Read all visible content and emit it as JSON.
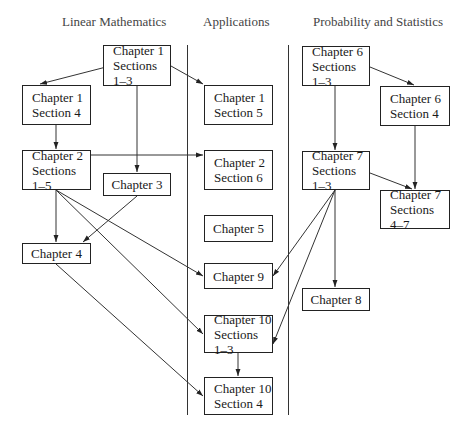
{
  "columns": [
    {
      "title": "Linear Mathematics",
      "x": 62
    },
    {
      "title": "Applications",
      "x": 203
    },
    {
      "title": "Probability and Statistics",
      "x": 313
    }
  ],
  "nodes": [
    {
      "id": "ch1s13",
      "line1": "Chapter 1",
      "line2": "Sections 1–3",
      "x": 103,
      "y": 45,
      "w": 68,
      "h": 41
    },
    {
      "id": "ch1s4",
      "line1": "Chapter 1",
      "line2": "Section 4",
      "x": 22,
      "y": 85,
      "w": 69,
      "h": 40
    },
    {
      "id": "ch1s5",
      "line1": "Chapter 1",
      "line2": "Section 5",
      "x": 204,
      "y": 85,
      "w": 69,
      "h": 40
    },
    {
      "id": "ch2s15",
      "line1": "Chapter 2",
      "line2": "Sections 1–5",
      "x": 22,
      "y": 150,
      "w": 69,
      "h": 40
    },
    {
      "id": "ch3",
      "line1": "Chapter 3",
      "line2": "",
      "x": 103,
      "y": 173,
      "w": 68,
      "h": 23
    },
    {
      "id": "ch2s6",
      "line1": "Chapter 2",
      "line2": "Section 6",
      "x": 204,
      "y": 150,
      "w": 69,
      "h": 40
    },
    {
      "id": "ch5",
      "line1": "Chapter 5",
      "line2": "",
      "x": 204,
      "y": 215,
      "w": 69,
      "h": 27
    },
    {
      "id": "ch4",
      "line1": "Chapter 4",
      "line2": "",
      "x": 22,
      "y": 243,
      "w": 69,
      "h": 21
    },
    {
      "id": "ch9",
      "line1": "Chapter 9",
      "line2": "",
      "x": 204,
      "y": 263,
      "w": 69,
      "h": 26
    },
    {
      "id": "ch10s13",
      "line1": "Chapter 10",
      "line2": "Sections 1–3",
      "x": 204,
      "y": 315,
      "w": 69,
      "h": 38
    },
    {
      "id": "ch10s4",
      "line1": "Chapter 10",
      "line2": "Section 4",
      "x": 204,
      "y": 377,
      "w": 69,
      "h": 38
    },
    {
      "id": "ch6s13",
      "line1": "Chapter 6",
      "line2": "Sections 1–3",
      "x": 302,
      "y": 46,
      "w": 68,
      "h": 40
    },
    {
      "id": "ch6s4",
      "line1": "Chapter 6",
      "line2": "Section 4",
      "x": 380,
      "y": 86,
      "w": 70,
      "h": 40
    },
    {
      "id": "ch7s13",
      "line1": "Chapter 7",
      "line2": "Sections 1–3",
      "x": 302,
      "y": 151,
      "w": 68,
      "h": 39
    },
    {
      "id": "ch7s47",
      "line1": "Chapter 7",
      "line2": "Sections 4–7",
      "x": 380,
      "y": 190,
      "w": 70,
      "h": 39
    },
    {
      "id": "ch8",
      "line1": "Chapter 8",
      "line2": "",
      "x": 302,
      "y": 288,
      "w": 68,
      "h": 23
    }
  ],
  "edges": [
    {
      "from": "ch1s13",
      "to": "ch1s4"
    },
    {
      "from": "ch1s13",
      "to": "ch1s5"
    },
    {
      "from": "ch1s13",
      "to": "ch3"
    },
    {
      "from": "ch1s4",
      "to": "ch2s15"
    },
    {
      "from": "ch2s15",
      "to": "ch2s6"
    },
    {
      "from": "ch2s15",
      "to": "ch4"
    },
    {
      "from": "ch2s15",
      "to": "ch9"
    },
    {
      "from": "ch2s15",
      "to": "ch10s13"
    },
    {
      "from": "ch3",
      "to": "ch4"
    },
    {
      "from": "ch4",
      "to": "ch10s4"
    },
    {
      "from": "ch10s13",
      "to": "ch10s4"
    },
    {
      "from": "ch6s13",
      "to": "ch6s4"
    },
    {
      "from": "ch6s13",
      "to": "ch7s13"
    },
    {
      "from": "ch6s4",
      "to": "ch7s47"
    },
    {
      "from": "ch7s13",
      "to": "ch7s47"
    },
    {
      "from": "ch7s13",
      "to": "ch8"
    },
    {
      "from": "ch7s13",
      "to": "ch9"
    },
    {
      "from": "ch7s13",
      "to": "ch10s13"
    }
  ],
  "edge_lines": [
    [
      110,
      66,
      40,
      84
    ],
    [
      171,
      66,
      203,
      84
    ],
    [
      137,
      86,
      137,
      172
    ],
    [
      56,
      125,
      56,
      149
    ],
    [
      91,
      155,
      203,
      155
    ],
    [
      56,
      190,
      56,
      242
    ],
    [
      56,
      190,
      203,
      276
    ],
    [
      56,
      190,
      203,
      334
    ],
    [
      137,
      196,
      83,
      242
    ],
    [
      56,
      264,
      203,
      396
    ],
    [
      238,
      353,
      238,
      376
    ],
    [
      370,
      67,
      414,
      85
    ],
    [
      335,
      86,
      335,
      150
    ],
    [
      415,
      126,
      415,
      189
    ],
    [
      370,
      173,
      412,
      189
    ],
    [
      335,
      190,
      335,
      287
    ],
    [
      335,
      190,
      273,
      276
    ],
    [
      335,
      190,
      273,
      344
    ]
  ],
  "dividers": [
    {
      "x": 187,
      "y1": 45,
      "y2": 415
    },
    {
      "x": 288,
      "y1": 45,
      "y2": 415
    }
  ]
}
